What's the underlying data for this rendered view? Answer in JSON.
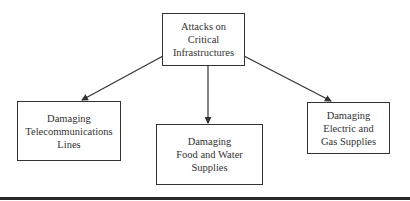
{
  "diagram": {
    "root": {
      "lines": [
        "Attacks on",
        "Critical",
        "Infrastructures"
      ]
    },
    "children": [
      {
        "lines": [
          "Damaging",
          "Telecommunications",
          "Lines"
        ]
      },
      {
        "lines": [
          "Damaging",
          "Food and Water",
          "Supplies"
        ]
      },
      {
        "lines": [
          "Damaging",
          "Electric and",
          "Gas Supplies"
        ]
      }
    ],
    "edges": [
      {
        "from": "root",
        "to": "children.0"
      },
      {
        "from": "root",
        "to": "children.1"
      },
      {
        "from": "root",
        "to": "children.2"
      }
    ],
    "colors": {
      "line": "#333333",
      "text": "#333333",
      "rule": "#2a2a2a"
    }
  }
}
